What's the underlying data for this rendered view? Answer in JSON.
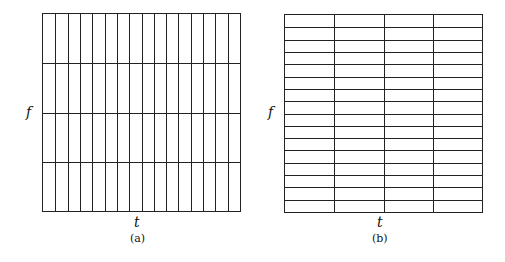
{
  "panels": [
    {
      "id": "a",
      "caption": "(a)",
      "xlabel": "t",
      "ylabel": "f",
      "columns": 16,
      "rows": 4
    },
    {
      "id": "b",
      "caption": "(b)",
      "xlabel": "t",
      "ylabel": "f",
      "columns": 4,
      "rows": 16
    }
  ]
}
